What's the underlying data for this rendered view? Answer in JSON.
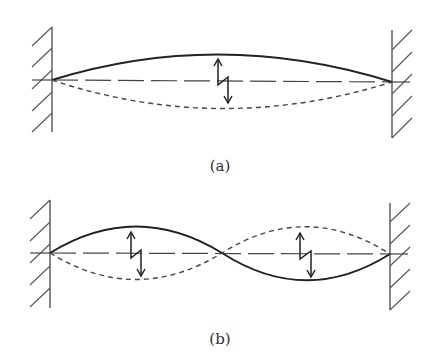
{
  "figure": {
    "panels": [
      {
        "id": "a",
        "caption": "(a)",
        "description": "String fixed between two walls vibrating in fundamental mode (one antinode)",
        "mode": 1
      },
      {
        "id": "b",
        "caption": "(b)",
        "description": "String fixed between two walls vibrating in second harmonic (two antinodes, one node at center)",
        "mode": 2
      }
    ],
    "legend": {
      "solid_curve": "displacement at one extreme",
      "dashed_curve": "displacement at opposite extreme",
      "dashed_axis": "equilibrium position",
      "zigzag_arrow": "oscillation direction"
    },
    "colors": {
      "line": "#222222",
      "wall": "#555555",
      "background": "#ffffff"
    }
  }
}
